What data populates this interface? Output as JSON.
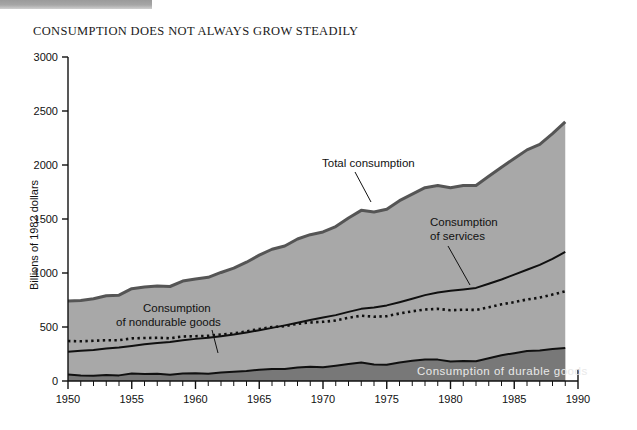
{
  "chart_title": "CONSUMPTION DOES NOT ALWAYS GROW STEADILY",
  "colors": {
    "total_fill": "#a8a8a8",
    "total_border": "#555555",
    "durable_fill": "#787878",
    "line": "#101010",
    "background": "#ffffff",
    "durable_label_text": "#e9e9e9"
  },
  "axes": {
    "y_title": "Billions of 1982 dollars",
    "y_ticks": [
      "0",
      "500",
      "1000",
      "1500",
      "2000",
      "2500",
      "3000"
    ],
    "x_ticks": [
      "1950",
      "1955",
      "1960",
      "1965",
      "1970",
      "1975",
      "1980",
      "1985",
      "1990"
    ]
  },
  "annotations": {
    "total": "Total consumption",
    "nondurable_line1": "Consumption",
    "nondurable_line2": "of nondurable goods",
    "services_line1": "Consumption",
    "services_line2": "of services",
    "durable": "Consumption of durable goods"
  },
  "chart_data": {
    "type": "area",
    "title": "CONSUMPTION DOES NOT ALWAYS GROW STEADILY",
    "xlabel": "",
    "ylabel": "Billions of 1982 dollars",
    "xlim": [
      1950,
      1990
    ],
    "ylim": [
      0,
      3000
    ],
    "grid": false,
    "legend": "inline-annotations",
    "x": [
      1950,
      1951,
      1952,
      1953,
      1954,
      1955,
      1956,
      1957,
      1958,
      1959,
      1960,
      1961,
      1962,
      1963,
      1964,
      1965,
      1966,
      1967,
      1968,
      1969,
      1970,
      1971,
      1972,
      1973,
      1974,
      1975,
      1976,
      1977,
      1978,
      1979,
      1980,
      1981,
      1982,
      1983,
      1984,
      1985,
      1986,
      1987,
      1988,
      1989
    ],
    "series": [
      {
        "name": "Total consumption",
        "type": "area-top",
        "values": [
          740,
          745,
          762,
          790,
          795,
          855,
          870,
          880,
          875,
          925,
          945,
          960,
          1005,
          1045,
          1100,
          1165,
          1220,
          1250,
          1315,
          1355,
          1380,
          1430,
          1510,
          1580,
          1565,
          1590,
          1670,
          1730,
          1790,
          1810,
          1790,
          1810,
          1810,
          1895,
          1980,
          2060,
          2140,
          2190,
          2290,
          2400
        ]
      },
      {
        "name": "Consumption of services",
        "type": "line",
        "values": [
          270,
          280,
          288,
          300,
          310,
          325,
          340,
          352,
          362,
          378,
          390,
          400,
          415,
          430,
          450,
          470,
          492,
          515,
          540,
          565,
          588,
          610,
          640,
          668,
          680,
          700,
          730,
          762,
          795,
          820,
          835,
          848,
          862,
          900,
          940,
          985,
          1030,
          1075,
          1130,
          1195
        ]
      },
      {
        "name": "Consumption of nondurable goods",
        "type": "dotted-line",
        "values": [
          370,
          368,
          372,
          378,
          378,
          395,
          398,
          400,
          396,
          412,
          415,
          418,
          430,
          440,
          460,
          482,
          500,
          508,
          530,
          542,
          548,
          560,
          585,
          605,
          595,
          600,
          625,
          645,
          662,
          668,
          655,
          660,
          658,
          682,
          710,
          730,
          755,
          772,
          800,
          830
        ]
      },
      {
        "name": "Consumption of durable goods",
        "type": "area-bottom",
        "values": [
          60,
          52,
          48,
          56,
          52,
          70,
          64,
          66,
          58,
          70,
          72,
          68,
          78,
          86,
          92,
          105,
          112,
          112,
          126,
          132,
          128,
          142,
          158,
          172,
          152,
          150,
          172,
          188,
          198,
          198,
          180,
          186,
          182,
          210,
          238,
          258,
          278,
          282,
          296,
          305
        ]
      }
    ],
    "annotations": [
      {
        "text": "Total consumption",
        "year": 1968,
        "value": 1990
      },
      {
        "text": "Consumption of nondurable goods",
        "year": 1956,
        "value": 800
      },
      {
        "text": "Consumption of services",
        "year": 1978,
        "value": 1520
      },
      {
        "text": "Consumption of durable goods",
        "year": 1983,
        "value": 175
      }
    ]
  }
}
